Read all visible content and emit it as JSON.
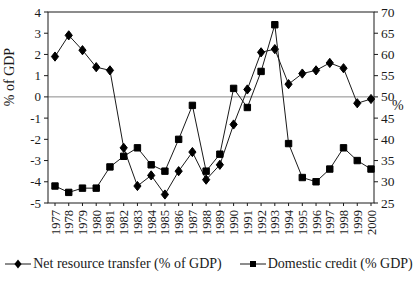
{
  "figure": {
    "background": "#ffffff"
  },
  "chart_data": {
    "type": "line",
    "title": "",
    "x": [
      1977,
      1978,
      1979,
      1980,
      1981,
      1982,
      1983,
      1984,
      1985,
      1986,
      1987,
      1988,
      1989,
      1990,
      1991,
      1992,
      1993,
      1994,
      1995,
      1996,
      1997,
      1998,
      1999,
      2000
    ],
    "series": [
      {
        "name": "Net resource transfer (% of GDP)",
        "axis": "left",
        "marker": "diamond",
        "values": [
          1.9,
          2.9,
          2.2,
          1.4,
          1.25,
          -2.4,
          -4.2,
          -3.7,
          -4.6,
          -3.5,
          -2.6,
          -3.9,
          -3.2,
          -1.3,
          0.35,
          2.1,
          2.25,
          0.6,
          1.1,
          1.25,
          1.6,
          1.35,
          -0.3,
          -0.1
        ]
      },
      {
        "name": "Domestic credit (% GDP)",
        "axis": "right",
        "marker": "square",
        "values": [
          29,
          27.5,
          28.5,
          28.5,
          33.5,
          36,
          38,
          34,
          32.5,
          40,
          48,
          32.5,
          36.5,
          52,
          47.5,
          56,
          67,
          39,
          31,
          30,
          33,
          38,
          35,
          33
        ]
      }
    ],
    "left_axis": {
      "label": "% of GDP",
      "min": -5,
      "max": 4,
      "tick_step": 1,
      "ticks": [
        4,
        3,
        2,
        1,
        0,
        -1,
        -2,
        -3,
        -4,
        -5
      ]
    },
    "right_axis": {
      "label": "%",
      "min": 25,
      "max": 70,
      "tick_step": 5,
      "ticks": [
        70,
        65,
        60,
        55,
        50,
        45,
        40,
        35,
        30,
        25
      ]
    },
    "grid": "zero-line-only",
    "legend_position": "bottom"
  },
  "colors": {
    "line": "#1a1a1a",
    "marker": "#000000",
    "zero_line": "#8a8a8a",
    "text": "#1a1a1a",
    "background": "#ffffff"
  }
}
